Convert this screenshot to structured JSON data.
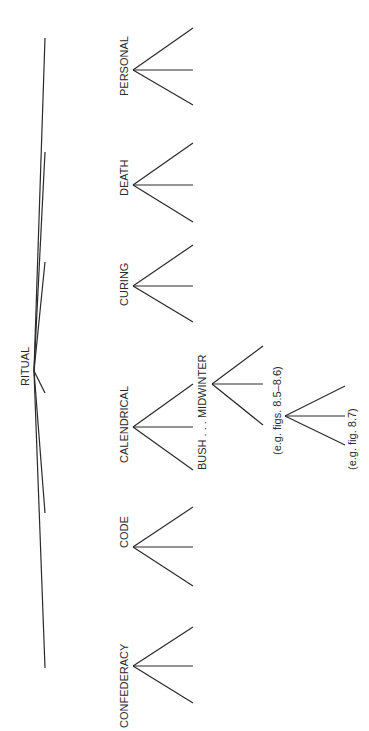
{
  "diagram": {
    "type": "tree",
    "orientation": "rotated-90-ccw",
    "line_color": "#2a2a2a",
    "root": {
      "label": "RITUAL",
      "apex": [
        34,
        371
      ],
      "label_pos": [
        20,
        386
      ]
    },
    "children": [
      {
        "label": "PERSONAL",
        "branch_end": [
          45,
          38
        ],
        "label_pos": [
          20,
          96
        ],
        "fan_apex": [
          34,
          70
        ],
        "fan_ends": [
          [
            91,
            28
          ],
          [
            91,
            70
          ],
          [
            91,
            105
          ]
        ]
      },
      {
        "label": "DEATH",
        "branch_end": [
          45,
          152
        ],
        "label_pos": [
          20,
          196
        ],
        "fan_apex": [
          34,
          185
        ],
        "fan_ends": [
          [
            91,
            143
          ],
          [
            91,
            185
          ],
          [
            91,
            222
          ]
        ]
      },
      {
        "label": "CURING",
        "branch_end": [
          45,
          262
        ],
        "label_pos": [
          20,
          306
        ],
        "fan_apex": [
          34,
          286
        ],
        "fan_ends": [
          [
            91,
            245
          ],
          [
            91,
            286
          ],
          [
            91,
            322
          ]
        ]
      },
      {
        "label": "CALENDRICAL",
        "branch_end": [
          45,
          393
        ],
        "label_pos": [
          20,
          463
        ],
        "fan_apex": [
          34,
          427
        ],
        "fan_ends": [
          [
            91,
            384
          ],
          [
            91,
            427
          ],
          [
            91,
            470
          ]
        ]
      },
      {
        "label": "CODE",
        "branch_end": [
          45,
          513
        ],
        "label_pos": [
          20,
          548
        ],
        "fan_apex": [
          34,
          547
        ],
        "fan_ends": [
          [
            91,
            507
          ],
          [
            91,
            547
          ],
          [
            91,
            586
          ]
        ]
      },
      {
        "label": "CONFEDERACY",
        "branch_end": [
          45,
          668
        ],
        "label_pos": [
          20,
          728
        ],
        "fan_apex": [
          34,
          666
        ],
        "fan_ends": [
          [
            91,
            627
          ],
          [
            91,
            666
          ],
          [
            91,
            703
          ]
        ]
      }
    ],
    "subfans": [
      {
        "label": "BUSH . . . MIDWINTER",
        "label_pos": [
          197,
          470
        ],
        "fan_apex": [
          212,
          384
        ],
        "fan_ends": [
          [
            263,
            346
          ],
          [
            263,
            384
          ],
          [
            263,
            425
          ]
        ]
      },
      {
        "label": "(e.g. figs. 8.5–8.6)",
        "label_pos": [
          272,
          455
        ],
        "fan_apex": [
          285,
          416
        ],
        "fan_ends": [
          [
            345,
            386
          ],
          [
            345,
            416
          ],
          [
            345,
            445
          ]
        ]
      },
      {
        "label": "(e.g. fig. 8.7)",
        "label_pos": [
          347,
          470
        ],
        "fan_apex": null,
        "fan_ends": []
      }
    ]
  }
}
